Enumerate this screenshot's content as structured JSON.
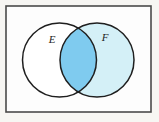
{
  "figure": {
    "kind": "venn-diagram",
    "caption": "",
    "universe": {
      "name": "universal-set-rectangle",
      "label": "",
      "border_color": "#4a4a4a",
      "fill_color": "#fdfdfd",
      "x": 6,
      "y": 6,
      "width": 145,
      "height": 106,
      "stroke_width": 1.6
    },
    "background_color": "#f7f6f3",
    "sets": [
      {
        "id": "E",
        "label": "E",
        "label_x": 52,
        "label_y": 40,
        "center_x": 59.5,
        "center_y": 60,
        "radius": 37,
        "fill_color": "#ffffff",
        "stroke_color": "#1f1f1f",
        "stroke_width": 1.5,
        "shaded": false
      },
      {
        "id": "F",
        "label": "F",
        "label_x": 105,
        "label_y": 38,
        "center_x": 97,
        "center_y": 60,
        "radius": 37,
        "fill_color": "#d4f0f7",
        "stroke_color": "#1f1f1f",
        "stroke_width": 1.5,
        "shaded": true
      }
    ],
    "intersection": {
      "id": "E-and-F",
      "label": "",
      "fill_color": "#7fcbef",
      "shaded": true
    },
    "colors": {
      "shade_light": "#d4f0f7",
      "shade_medium": "#7fcbef",
      "outline": "#1f1f1f",
      "frame": "#4a4a4a",
      "paper": "#f7f6f3",
      "inner_paper": "#fdfdfd"
    }
  }
}
